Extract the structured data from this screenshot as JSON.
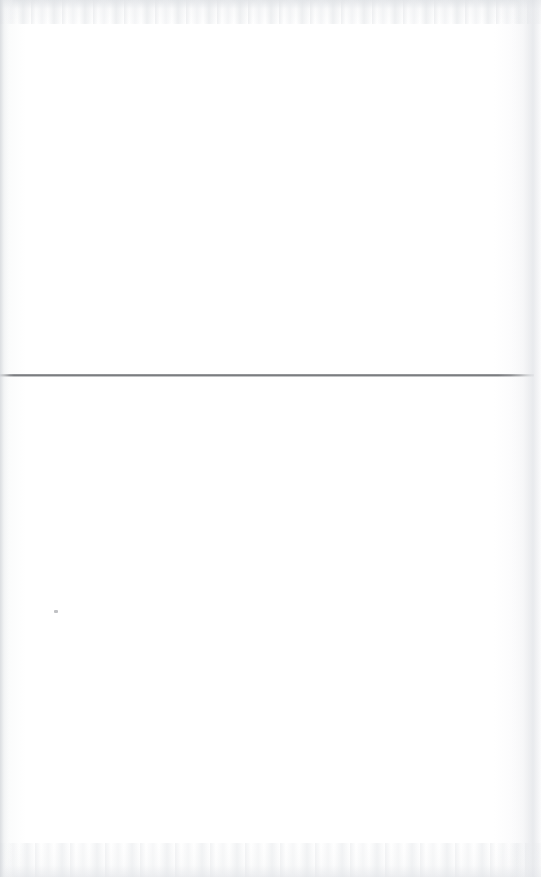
{
  "document": {
    "kind": "scanned-page",
    "page_text": "",
    "visible_text_blocks": [],
    "background_color": "#ffffff",
    "rule_color": "#56585c",
    "artifact_color": "#e2e4e7"
  },
  "page": {
    "width_px": 541,
    "height_px": 877,
    "upper_region_label": "",
    "lower_region_label": ""
  },
  "rule": {
    "label": "",
    "top_px": 374,
    "left_px": 0,
    "width_px": 534,
    "thickness_px": 3,
    "color": "#56585c"
  },
  "artifacts": {
    "top_edge_label": "",
    "bottom_edge_label": "",
    "left_edge_label": "",
    "right_edge_label": "",
    "speck_label": "",
    "speck_x_px": 54,
    "speck_y_px": 610
  }
}
